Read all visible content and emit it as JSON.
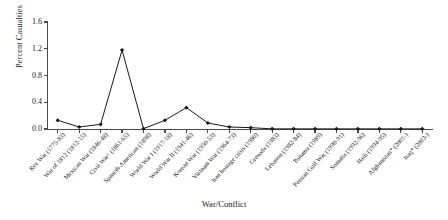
{
  "chart_data": {
    "type": "line",
    "title": "",
    "xlabel": "War/Conflict",
    "ylabel": "Percent Casualties",
    "ylim": [
      0.0,
      1.6
    ],
    "yticks": [
      "0.0",
      "0.4",
      "0.8",
      "1.2",
      "1.6"
    ],
    "ytick_values": [
      0.0,
      0.4,
      0.8,
      1.2,
      1.6
    ],
    "grid": false,
    "legend": "none",
    "marker": "filled-diamond",
    "line_color": "#1a1a1a",
    "marker_color": "#1a1a1a",
    "axis_color": "#4a4a4a",
    "categories": [
      "Rev War (1775-83)",
      "War of 1812 (1812-15)",
      "Mexican War (1846-48)",
      "Civil War^ (1861-65)",
      "Spanish-American (1898)",
      "World War I (1917-18)",
      "World War II (1941-46)",
      "Korean War (1950-53)",
      "Vietnam War (1964-73)",
      "Iran hostage crisis (1980)",
      "Grenada (1983)",
      "Lebanon (1982-84)",
      "Panama (1989)",
      "Persian Gulf War (1990-91)",
      "Somalia (1992-96)",
      "Haiti (1994-95)",
      "Afghanistan* (2001-)",
      "Iraq* (2003-)"
    ],
    "values": [
      0.13,
      0.03,
      0.07,
      1.18,
      0.005,
      0.13,
      0.32,
      0.09,
      0.03,
      0.02,
      0.002,
      0.002,
      0.002,
      0.002,
      0.002,
      0.002,
      0.002,
      0.002
    ],
    "series": [
      {
        "name": "Percent Casualties",
        "values": [
          0.13,
          0.03,
          0.07,
          1.18,
          0.005,
          0.13,
          0.32,
          0.09,
          0.03,
          0.02,
          0.002,
          0.002,
          0.002,
          0.002,
          0.002,
          0.002,
          0.002,
          0.002
        ]
      }
    ]
  }
}
